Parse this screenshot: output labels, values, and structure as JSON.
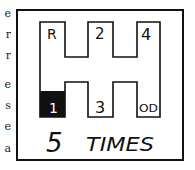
{
  "left_margin_fragments": [
    "e",
    "r",
    "r",
    "e",
    "s",
    "e",
    "a"
  ],
  "diagram": {
    "gears": [
      {
        "id": "reverse",
        "label": "R",
        "highlighted": false
      },
      {
        "id": "second",
        "label": "2",
        "highlighted": false
      },
      {
        "id": "fourth",
        "label": "4",
        "highlighted": false
      },
      {
        "id": "first",
        "label": "1",
        "highlighted": true
      },
      {
        "id": "third",
        "label": "3",
        "highlighted": false
      },
      {
        "id": "overdrive",
        "label": "OD",
        "highlighted": false
      }
    ],
    "caption": "5 TIMES",
    "caption_number": "5",
    "caption_word": "TIMES",
    "colors": {
      "ink": "#111111",
      "paper": "#ffffff",
      "highlight_fill": "#111111",
      "highlight_text": "#ffffff"
    }
  }
}
